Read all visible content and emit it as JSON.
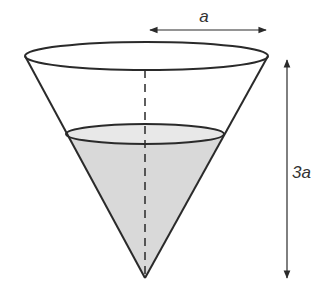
{
  "diagram": {
    "labels": {
      "radius": "a",
      "height": "3a"
    },
    "colors": {
      "stroke": "#2a2a2a",
      "water_fill": "#d9d9d9",
      "water_surface": "#e8e8e8",
      "text": "#333333"
    }
  }
}
